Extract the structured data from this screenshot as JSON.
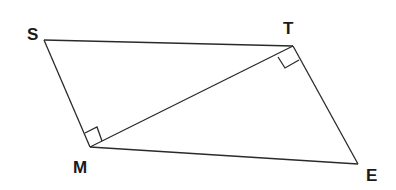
{
  "diagram": {
    "type": "geometry",
    "stroke_color": "#2a2a2a",
    "points": {
      "S": {
        "label": "S",
        "x": 44,
        "y": 40
      },
      "T": {
        "label": "T",
        "x": 293,
        "y": 46
      },
      "M": {
        "label": "M",
        "x": 90,
        "y": 147
      },
      "E": {
        "label": "E",
        "x": 358,
        "y": 164
      }
    },
    "segments": [
      "ST",
      "SM",
      "MT",
      "TE",
      "ME"
    ],
    "right_angles": [
      "SMT",
      "MTE"
    ]
  }
}
